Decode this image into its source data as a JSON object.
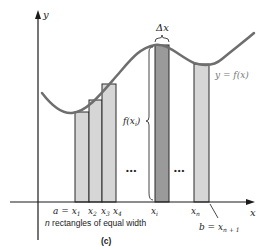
{
  "figure": {
    "caption": "(c)",
    "colors": {
      "axis": "#1a1a1a",
      "curve": "#6e6e6e",
      "rect_fill": "#d6d6d6",
      "rect_highlight_fill": "#9a9a9a",
      "rect_stroke": "#2a2a2a",
      "curve_label": "#7a7a7a"
    },
    "axes": {
      "x_label": "x",
      "y_label": "y"
    },
    "curve_label": "y = f(x)",
    "delta_label": "Δx",
    "height_label": "f(x",
    "height_label_sub": "i",
    "height_label_close": ")",
    "ellipsis": "•••",
    "x_ticks": {
      "a_eq": "a = x",
      "a_sub": "1",
      "x2": "x",
      "x2_sub": "2",
      "x3": "x",
      "x3_sub": "3",
      "x4": "x",
      "x4_sub": "4",
      "xi": "x",
      "xi_sub": "i",
      "xn": "x",
      "xn_sub": "n",
      "b_eq": "b = x",
      "b_sub": "n + 1"
    },
    "footnote": "n rectangles of equal width",
    "footnote_n": "n",
    "footnote_rest": " rectangles of equal width"
  },
  "rectangles": [
    {
      "name": "x1",
      "x": 75,
      "width": 14,
      "top": 112
    },
    {
      "name": "x2",
      "x": 89,
      "width": 13,
      "top": 100
    },
    {
      "name": "x3",
      "x": 102,
      "width": 14,
      "top": 84
    },
    {
      "name": "xi",
      "x": 155,
      "width": 14,
      "top": 45,
      "highlight": true
    },
    {
      "name": "xn",
      "x": 194,
      "width": 15,
      "top": 64
    }
  ]
}
